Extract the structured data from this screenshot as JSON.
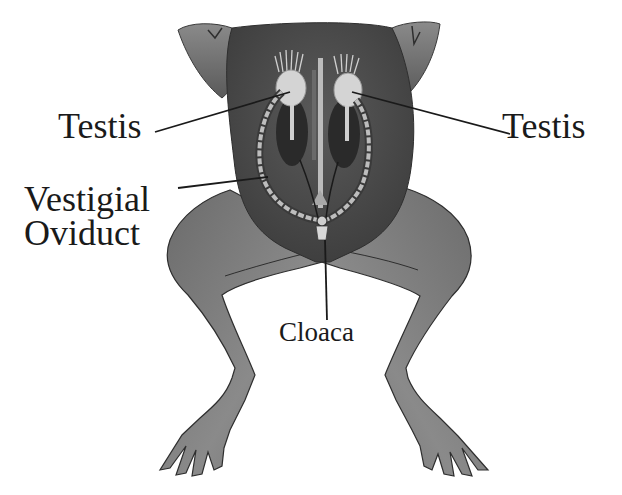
{
  "diagram": {
    "labels": {
      "testis_left": "Testis",
      "testis_right": "Testis",
      "vestigial_oviduct_line1": "Vestigial",
      "vestigial_oviduct_line2": "Oviduct",
      "cloaca": "Cloaca"
    },
    "colors": {
      "body": "#6e6e6e",
      "body_dark": "#4a4a4a",
      "organ_light": "#d6d6d6",
      "kidney": "#2e2e2e",
      "leader_line": "#1a1a1a",
      "text": "#1a1a1a"
    }
  }
}
